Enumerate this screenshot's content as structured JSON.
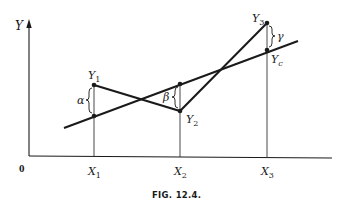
{
  "figure": {
    "caption": "FIG.  12.4.",
    "stroke_color": "#1a1a1a"
  },
  "axes": {
    "y_label": "Y",
    "origin_label": "0",
    "x_ticks": [
      {
        "label": "X",
        "sub": "1",
        "x": 94
      },
      {
        "label": "X",
        "sub": "2",
        "x": 180
      },
      {
        "label": "X",
        "sub": "3",
        "x": 267
      }
    ]
  },
  "points": {
    "Y1": {
      "label": "Y",
      "sub": "1",
      "x": 94,
      "y": 85
    },
    "Y2": {
      "label": "Y",
      "sub": "2",
      "x": 180,
      "y": 111
    },
    "Y3": {
      "label": "Y",
      "sub": "3",
      "x": 267,
      "y": 23
    },
    "Yc": {
      "label": "Y",
      "sub": "c",
      "x": 267,
      "y": 50
    }
  },
  "regression_line": {
    "x1": 64,
    "y1": 128,
    "x2": 298,
    "y2": 41
  },
  "deviations": {
    "alpha": "α",
    "beta": "β",
    "gamma": "γ"
  }
}
